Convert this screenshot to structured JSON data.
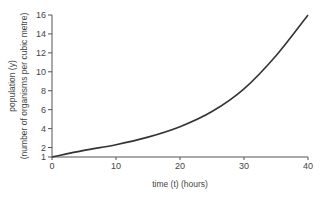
{
  "chart_data": {
    "type": "line",
    "title": "",
    "xlabel": "time (t) (hours)",
    "ylabel": "population (y)",
    "ylabel_sub": "(number of organisms per cubic metre)",
    "xlim": [
      0,
      40
    ],
    "ylim": [
      1,
      16
    ],
    "x_ticks": [
      0,
      10,
      20,
      30,
      40
    ],
    "y_ticks": [
      1,
      2,
      4,
      6,
      8,
      10,
      12,
      14,
      16
    ],
    "grid": false,
    "legend": null,
    "series": [
      {
        "name": "population",
        "x": [
          0,
          5,
          10,
          15,
          20,
          25,
          30,
          35,
          40
        ],
        "y": [
          1,
          1.7,
          2.3,
          3.1,
          4.2,
          5.8,
          8.2,
          11.7,
          16
        ]
      }
    ]
  },
  "labels": {
    "xlabel": "time (t) (hours)",
    "ylabel": "population (y)",
    "ylabel_sub": "(number of organisms per cubic metre)"
  }
}
